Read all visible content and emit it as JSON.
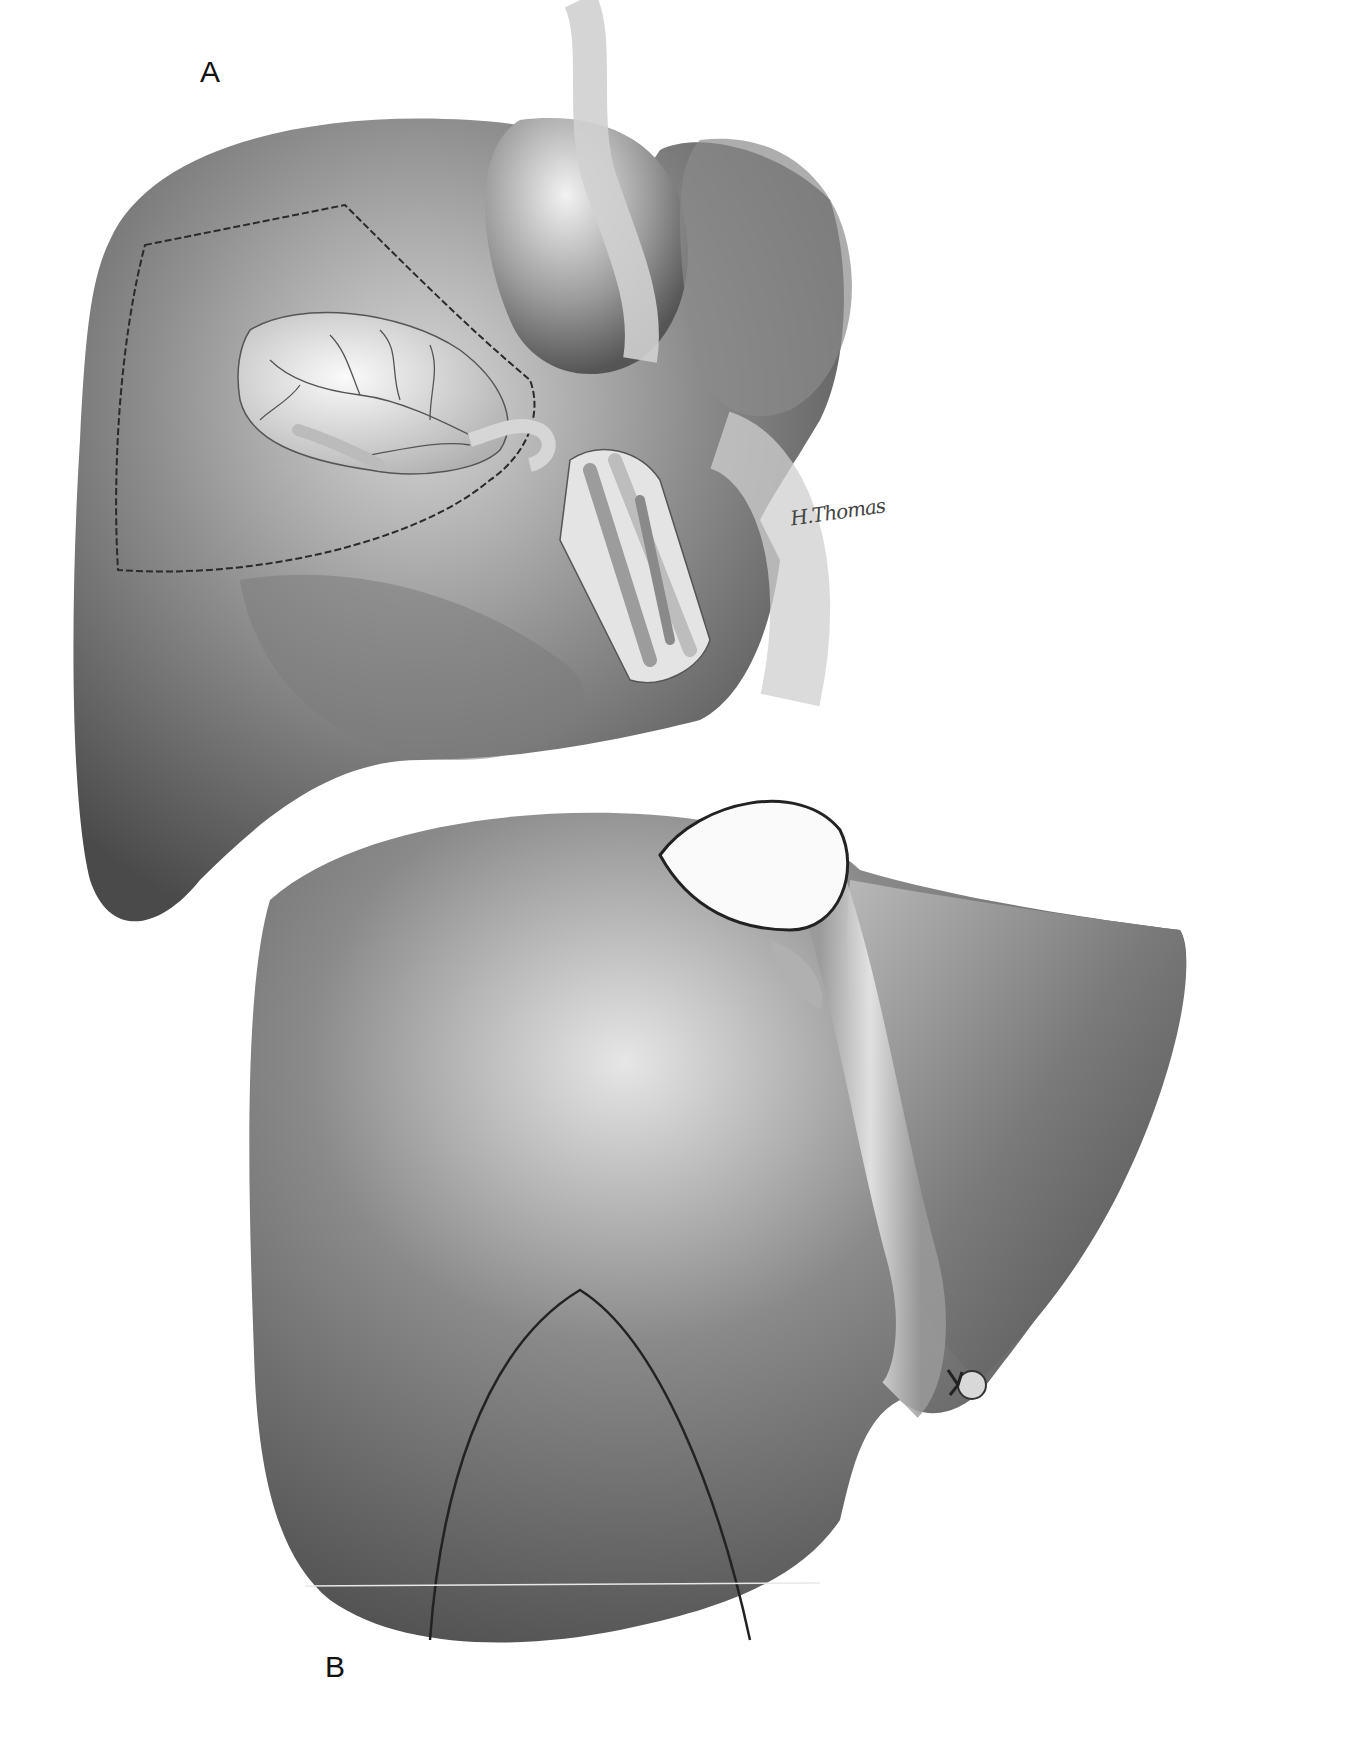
{
  "figure": {
    "panels": [
      {
        "label": "A",
        "subject": "liver inferior view with gallbladder, porta hepatis dissection and resection lines"
      },
      {
        "label": "B",
        "subject": "liver diaphragmatic surface with arched resection line and ligated round ligament"
      }
    ],
    "signature": "H.Thomas",
    "colors": {
      "background": "#ffffff",
      "organ_dark": "#5a5a5a",
      "organ_mid": "#8c8c8c",
      "organ_light": "#dcdcdc",
      "line": "#222222"
    }
  }
}
